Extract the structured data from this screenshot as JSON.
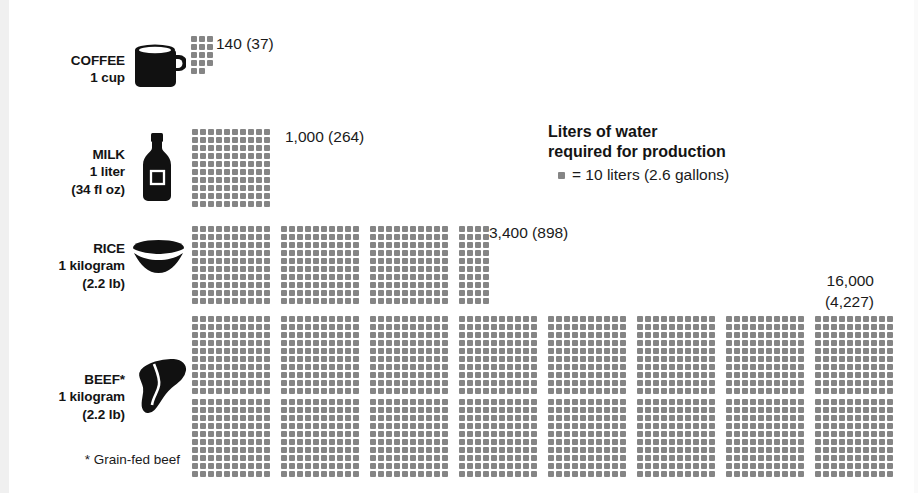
{
  "legend": {
    "title_line1": "Liters of water",
    "title_line2": "required for production",
    "key_text": "= 10 liters (2.6 gallons)",
    "unit_per_dot": 10,
    "swatch_name": "dot-swatch"
  },
  "footnote": "* Grain-fed beef",
  "colors": {
    "dot": "#858585",
    "text": "#1a1a1a",
    "label": "#141414",
    "background": "#ffffff",
    "icon": "#111111"
  },
  "chart_data": {
    "type": "bar",
    "title": "Liters of water required for production",
    "subtitle": "= 10 liters (2.6 gallons) per dot",
    "xlabel": "",
    "ylabel": "",
    "unit": "liters",
    "secondary_unit": "gallons",
    "dot_value": 10,
    "grid": false,
    "legend_position": "upper-right",
    "categories": [
      "COFFEE",
      "MILK",
      "RICE",
      "BEEF*"
    ],
    "values": [
      140,
      1000,
      3400,
      16000
    ],
    "values_gallons": [
      37,
      264,
      898,
      4227
    ],
    "value_labels": [
      "140 (37)",
      "1,000 (264)",
      "3,400 (898)",
      "16,000 (4,227)"
    ]
  },
  "items": [
    {
      "id": "coffee",
      "name_line": "COFFEE",
      "qty_line": "1 cup",
      "unit_line": "",
      "icon": "coffee-mug-icon",
      "liters": 140,
      "gallons": 37,
      "value_label": "140 (37)",
      "value_label_line1": "140 (37)",
      "value_label_line2": "",
      "dots_total": 14,
      "blocks": [
        {
          "cols": 2,
          "rows": 5
        },
        {
          "cols": 1,
          "rows": 4
        }
      ]
    },
    {
      "id": "milk",
      "name_line": "MILK",
      "qty_line": "1 liter",
      "unit_line": "(34 fl oz)",
      "icon": "milk-bottle-icon",
      "liters": 1000,
      "gallons": 264,
      "value_label": "1,000 (264)",
      "value_label_line1": "1,000 (264)",
      "value_label_line2": "",
      "dots_total": 100,
      "blocks": [
        {
          "cols": 10,
          "rows": 10
        }
      ]
    },
    {
      "id": "rice",
      "name_line": "RICE",
      "qty_line": "1 kilogram",
      "unit_line": "(2.2 lb)",
      "icon": "rice-bowl-icon",
      "liters": 3400,
      "gallons": 898,
      "value_label": "3,400 (898)",
      "value_label_line1": "3,400 (898)",
      "value_label_line2": "",
      "dots_total": 340,
      "blocks": [
        {
          "cols": 10,
          "rows": 10
        },
        {
          "cols": 10,
          "rows": 10
        },
        {
          "cols": 10,
          "rows": 10
        },
        {
          "cols": 4,
          "rows": 10
        }
      ]
    },
    {
      "id": "beef",
      "name_line": "BEEF*",
      "qty_line": "1 kilogram",
      "unit_line": "(2.2 lb)",
      "icon": "beef-steak-icon",
      "liters": 16000,
      "gallons": 4227,
      "value_label": "16,000 (4,227)",
      "value_label_line1": "16,000",
      "value_label_line2": "(4,227)",
      "dots_total": 1600,
      "blocks_per_row": 8,
      "rows_of_blocks": 2,
      "blocks": [
        {
          "cols": 10,
          "rows": 10
        },
        {
          "cols": 10,
          "rows": 10
        },
        {
          "cols": 10,
          "rows": 10
        },
        {
          "cols": 10,
          "rows": 10
        },
        {
          "cols": 10,
          "rows": 10
        },
        {
          "cols": 10,
          "rows": 10
        },
        {
          "cols": 10,
          "rows": 10
        },
        {
          "cols": 10,
          "rows": 10
        }
      ],
      "blocks_row2": [
        {
          "cols": 10,
          "rows": 10
        },
        {
          "cols": 10,
          "rows": 10
        },
        {
          "cols": 10,
          "rows": 10
        },
        {
          "cols": 10,
          "rows": 10
        },
        {
          "cols": 10,
          "rows": 10
        },
        {
          "cols": 10,
          "rows": 10
        },
        {
          "cols": 10,
          "rows": 10
        },
        {
          "cols": 10,
          "rows": 10
        }
      ]
    }
  ]
}
